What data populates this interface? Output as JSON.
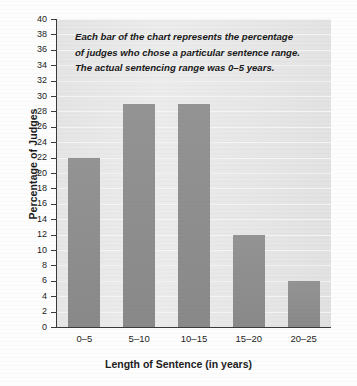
{
  "chart_data": {
    "type": "bar",
    "title": "",
    "categories": [
      "0–5",
      "5–10",
      "10–15",
      "15–20",
      "20–25"
    ],
    "values": [
      22,
      29,
      29,
      12,
      6
    ],
    "series": [
      {
        "name": "Percentage of Judges",
        "values": [
          22,
          29,
          29,
          12,
          6
        ]
      }
    ],
    "xlabel": "Length of Sentence (in years)",
    "ylabel": "Percentage of Judges",
    "ylim": [
      0,
      40
    ],
    "ytick_step": 2,
    "yticks": [
      0,
      2,
      4,
      6,
      8,
      10,
      12,
      14,
      16,
      18,
      20,
      22,
      24,
      26,
      28,
      30,
      32,
      34,
      36,
      38,
      40
    ],
    "ytick_labels": [
      "0",
      "2",
      "4",
      "6",
      "8",
      "10",
      "12",
      "14",
      "16",
      "18",
      "20",
      "22",
      "24",
      "26",
      "28",
      "30",
      "32",
      "34",
      "36",
      "38",
      "40"
    ],
    "grid": true,
    "legend": false,
    "legend_position": "none",
    "annotations": [
      "Each bar of the chart represents the percentage",
      "of judges who chose a particular sentence range.",
      "The actual sentencing range was 0–5 years."
    ],
    "colors": {
      "bar": "#8e8e8e",
      "plot_background": "#e8e8e8",
      "gridline": "#f4f4f4",
      "axis": "#3a3a3a",
      "text": "#1c1c1c",
      "page_background": "#fdfdfd"
    }
  }
}
